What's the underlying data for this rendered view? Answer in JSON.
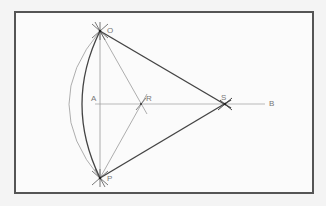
{
  "diagram": {
    "title": "",
    "points": [
      {
        "name": "O",
        "label": "O",
        "x": 100,
        "y": 31
      },
      {
        "name": "P",
        "label": "P",
        "x": 100,
        "y": 178
      },
      {
        "name": "A",
        "label": "A",
        "x": 100,
        "y": 104
      },
      {
        "name": "R",
        "label": "R",
        "x": 141,
        "y": 104
      },
      {
        "name": "S",
        "label": "S",
        "x": 225,
        "y": 104
      },
      {
        "name": "B",
        "label": "B",
        "x": 265,
        "y": 104
      }
    ],
    "labels": {
      "O": "O",
      "P": "P",
      "A": "A",
      "R": "R",
      "S": "S",
      "B": "B"
    },
    "colors": {
      "frame": "#555555",
      "thick_line": "#444444",
      "thin_line": "#999999",
      "label": "#777777"
    }
  }
}
